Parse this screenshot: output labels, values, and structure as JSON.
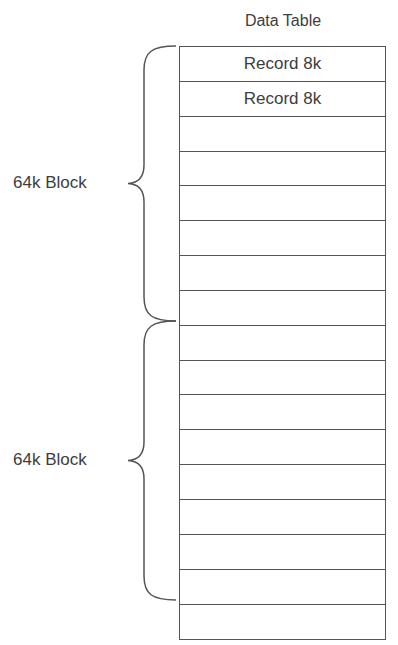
{
  "diagram": {
    "title": "Data Table",
    "rows": [
      {
        "label": "Record 8k"
      },
      {
        "label": "Record 8k"
      },
      {
        "label": ""
      },
      {
        "label": ""
      },
      {
        "label": ""
      },
      {
        "label": ""
      },
      {
        "label": ""
      },
      {
        "label": ""
      },
      {
        "label": ""
      },
      {
        "label": ""
      },
      {
        "label": ""
      },
      {
        "label": ""
      },
      {
        "label": ""
      },
      {
        "label": ""
      },
      {
        "label": ""
      },
      {
        "label": ""
      },
      {
        "label": ""
      }
    ],
    "blocks": [
      {
        "label": "64k Block",
        "start_row": 0,
        "end_row": 7
      },
      {
        "label": "64k Block",
        "start_row": 8,
        "end_row": 15
      }
    ],
    "colors": {
      "line": "#555555",
      "text": "#3d3d3d",
      "background": "#ffffff"
    }
  }
}
